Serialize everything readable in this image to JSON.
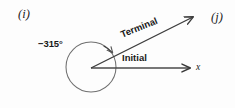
{
  "figure": {
    "type": "angle-diagram",
    "background_color": "#fdfdfd",
    "stroke_color": "#4a4a4a",
    "text_color": "#191919",
    "panel_tags": [
      {
        "name": "panel-tag-i",
        "text": "(i)"
      },
      {
        "name": "panel-tag-j",
        "text": "(j)"
      }
    ],
    "labels": {
      "angle_measure": "−315°",
      "initial_side": "Initial",
      "terminal_side": "Terminal",
      "x_axis": "x"
    },
    "geometry": {
      "vertex": [
        91,
        68
      ],
      "circle_center": [
        91,
        67
      ],
      "circle_radius": 25,
      "initial_ray_end": [
        193,
        68
      ],
      "terminal_ray_end": [
        196,
        15
      ],
      "terminal_ray_angle_deg": -22,
      "rotation_direction": "clockwise",
      "angle_degrees": -315
    }
  }
}
